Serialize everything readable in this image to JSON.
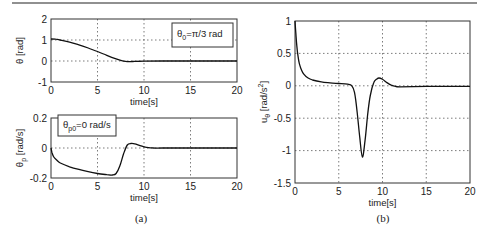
{
  "captions": {
    "left": "(a)",
    "right": "(b)"
  },
  "chart_data": [
    {
      "id": "theta",
      "type": "line",
      "title": "",
      "xlabel": "time[s]",
      "ylabel": "θ [rad]",
      "xlim": [
        0,
        20
      ],
      "ylim": [
        -1,
        2
      ],
      "xticks": [
        0,
        5,
        10,
        15,
        20
      ],
      "yticks": [
        -1,
        0,
        1,
        2
      ],
      "xtick_labels": [
        "0",
        "5",
        "10",
        "15",
        "20"
      ],
      "ytick_labels": [
        "-1",
        "0",
        "1",
        "2"
      ],
      "grid": true,
      "legend": {
        "text_main": "θ",
        "text_sub": "0",
        "text_rest": "=π/3 rad",
        "placement": "top-right"
      },
      "series": [
        {
          "name": "theta",
          "x": [
            0,
            0.5,
            1,
            2,
            3,
            4,
            5,
            6,
            7,
            7.5,
            8,
            8.5,
            9,
            10,
            12,
            15,
            20
          ],
          "y": [
            1.047,
            1.04,
            1.0,
            0.9,
            0.77,
            0.62,
            0.45,
            0.27,
            0.1,
            0.03,
            -0.02,
            -0.03,
            -0.02,
            -0.005,
            0,
            0,
            0
          ]
        }
      ]
    },
    {
      "id": "theta_p",
      "type": "line",
      "title": "",
      "xlabel": "time[s]",
      "ylabel": "θp [rad/s]",
      "xlim": [
        0,
        20
      ],
      "ylim": [
        -0.2,
        0.2
      ],
      "xticks": [
        0,
        5,
        10,
        15,
        20
      ],
      "yticks": [
        -0.2,
        0,
        0.2
      ],
      "xtick_labels": [
        "0",
        "5",
        "10",
        "15",
        "20"
      ],
      "ytick_labels": [
        "-0.2",
        "0",
        "0.2"
      ],
      "grid": true,
      "legend": {
        "text_main": "θ",
        "text_sub": "p0",
        "text_rest": "=0 rad/s",
        "placement": "top-left"
      },
      "series": [
        {
          "name": "theta_p",
          "x": [
            0,
            0.1,
            0.3,
            0.6,
            1,
            2,
            3,
            4,
            5,
            6,
            6.6,
            7,
            7.4,
            7.8,
            8.2,
            8.6,
            9,
            9.5,
            10,
            10.5,
            11,
            12,
            15,
            20
          ],
          "y": [
            0,
            -0.03,
            -0.06,
            -0.08,
            -0.1,
            -0.125,
            -0.143,
            -0.158,
            -0.17,
            -0.178,
            -0.18,
            -0.17,
            -0.12,
            -0.04,
            0.02,
            0.03,
            0.028,
            0.018,
            0.008,
            0.002,
            0,
            0,
            0,
            0
          ]
        }
      ]
    },
    {
      "id": "u_theta",
      "type": "line",
      "title": "",
      "xlabel": "time[s]",
      "ylabel": "uθ [rad/s²]",
      "xlim": [
        0,
        20
      ],
      "ylim": [
        -1.5,
        1
      ],
      "xticks": [
        0,
        5,
        10,
        15,
        20
      ],
      "yticks": [
        -1.5,
        -1,
        -0.5,
        0,
        0.5,
        1
      ],
      "xtick_labels": [
        "0",
        "5",
        "10",
        "15",
        "20"
      ],
      "ytick_labels": [
        "-1.5",
        "-1",
        "-0.5",
        "0",
        "0.5",
        "1"
      ],
      "grid": true,
      "series": [
        {
          "name": "u_theta",
          "x": [
            0,
            0.1,
            0.2,
            0.35,
            0.5,
            0.75,
            1,
            1.5,
            2,
            3,
            4,
            5,
            6,
            6.5,
            6.8,
            7.1,
            7.4,
            7.7,
            8.0,
            8.3,
            8.6,
            9.0,
            9.3,
            9.6,
            10,
            10.5,
            11,
            11.5,
            12,
            15,
            20
          ],
          "y": [
            1.0,
            0.8,
            0.62,
            0.45,
            0.34,
            0.24,
            0.18,
            0.12,
            0.09,
            0.06,
            0.045,
            0.035,
            0.025,
            0.0,
            -0.1,
            -0.4,
            -0.8,
            -1.1,
            -0.85,
            -0.45,
            -0.15,
            0.05,
            0.1,
            0.12,
            0.1,
            0.05,
            0.01,
            -0.01,
            -0.015,
            -0.01,
            -0.01
          ]
        }
      ]
    }
  ]
}
